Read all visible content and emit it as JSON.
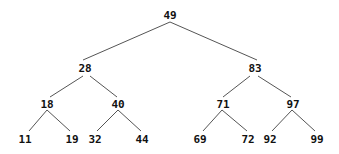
{
  "diagram": {
    "type": "binary-search-tree",
    "colors": {
      "edge": "#555555",
      "text": "#111111",
      "background": "#ffffff"
    },
    "nodes": [
      {
        "id": "n49",
        "value": "49",
        "x": 170,
        "y": 15
      },
      {
        "id": "n28",
        "value": "28",
        "x": 85,
        "y": 68
      },
      {
        "id": "n83",
        "value": "83",
        "x": 255,
        "y": 68
      },
      {
        "id": "n18",
        "value": "18",
        "x": 47,
        "y": 104
      },
      {
        "id": "n40",
        "value": "40",
        "x": 118,
        "y": 104
      },
      {
        "id": "n71",
        "value": "71",
        "x": 223,
        "y": 104
      },
      {
        "id": "n97",
        "value": "97",
        "x": 293,
        "y": 104
      },
      {
        "id": "n11",
        "value": "11",
        "x": 25,
        "y": 139
      },
      {
        "id": "n19",
        "value": "19",
        "x": 72,
        "y": 139
      },
      {
        "id": "n32",
        "value": "32",
        "x": 95,
        "y": 139
      },
      {
        "id": "n44",
        "value": "44",
        "x": 142,
        "y": 139
      },
      {
        "id": "n69",
        "value": "69",
        "x": 200,
        "y": 139
      },
      {
        "id": "n72",
        "value": "72",
        "x": 248,
        "y": 139
      },
      {
        "id": "n92",
        "value": "92",
        "x": 270,
        "y": 139
      },
      {
        "id": "n99",
        "value": "99",
        "x": 317,
        "y": 139
      }
    ],
    "edges": [
      {
        "from": "n49",
        "to": "n28",
        "x1": 170,
        "y1": 22,
        "x2": 83,
        "y2": 60
      },
      {
        "from": "n49",
        "to": "n83",
        "x1": 170,
        "y1": 22,
        "x2": 257,
        "y2": 60
      },
      {
        "from": "n28",
        "to": "n18",
        "x1": 83,
        "y1": 76,
        "x2": 50,
        "y2": 97
      },
      {
        "from": "n28",
        "to": "n40",
        "x1": 90,
        "y1": 76,
        "x2": 117,
        "y2": 97
      },
      {
        "from": "n83",
        "to": "n71",
        "x1": 250,
        "y1": 76,
        "x2": 223,
        "y2": 97
      },
      {
        "from": "n83",
        "to": "n97",
        "x1": 258,
        "y1": 76,
        "x2": 291,
        "y2": 97
      },
      {
        "from": "n18",
        "to": "n11",
        "x1": 47,
        "y1": 110,
        "x2": 29,
        "y2": 131
      },
      {
        "from": "n18",
        "to": "n19",
        "x1": 47,
        "y1": 110,
        "x2": 70,
        "y2": 131
      },
      {
        "from": "n40",
        "to": "n32",
        "x1": 118,
        "y1": 110,
        "x2": 97,
        "y2": 131
      },
      {
        "from": "n40",
        "to": "n44",
        "x1": 118,
        "y1": 110,
        "x2": 141,
        "y2": 131
      },
      {
        "from": "n71",
        "to": "n69",
        "x1": 222,
        "y1": 110,
        "x2": 203,
        "y2": 131
      },
      {
        "from": "n71",
        "to": "n72",
        "x1": 222,
        "y1": 110,
        "x2": 247,
        "y2": 131
      },
      {
        "from": "n97",
        "to": "n92",
        "x1": 292,
        "y1": 110,
        "x2": 272,
        "y2": 131
      },
      {
        "from": "n97",
        "to": "n99",
        "x1": 292,
        "y1": 110,
        "x2": 315,
        "y2": 131
      }
    ]
  }
}
